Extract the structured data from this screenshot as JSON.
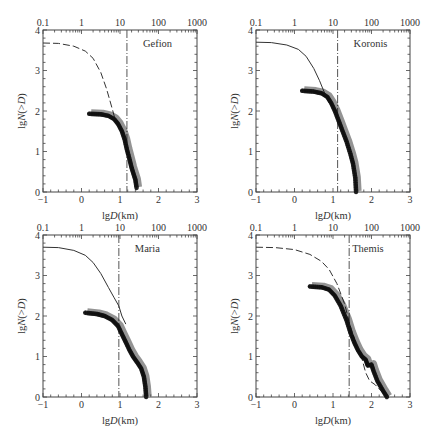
{
  "chart_data": [
    {
      "type": "line",
      "title": "Gefion",
      "xlabel": "lgD(km)",
      "ylabel": "lgN(>D)",
      "xlim": [
        -1,
        3
      ],
      "ylim": [
        0,
        4
      ],
      "x_ticks": [
        "-1",
        "0",
        "1",
        "2",
        "3"
      ],
      "y_ticks": [
        "0",
        "1",
        "2",
        "3",
        "4"
      ],
      "top_axis_ticks": [
        "0.1",
        "1",
        "10",
        "100",
        "1000"
      ],
      "vertical_dashdot_x": 1.18,
      "series": [
        {
          "name": "model (dashed)",
          "x": [
            -1,
            -0.6,
            -0.2,
            0.1,
            0.3,
            0.5,
            0.65,
            0.8,
            0.9
          ],
          "y": [
            3.68,
            3.67,
            3.6,
            3.48,
            3.3,
            2.95,
            2.55,
            2.05,
            1.7
          ]
        },
        {
          "name": "observed (crosses)",
          "x": [
            0.2,
            0.5,
            0.7,
            0.85,
            0.95,
            1.05,
            1.12,
            1.18,
            1.25,
            1.3,
            1.35,
            1.4,
            1.43
          ],
          "y": [
            1.93,
            1.92,
            1.88,
            1.8,
            1.68,
            1.5,
            1.3,
            1.05,
            0.8,
            0.6,
            0.45,
            0.3,
            0.1
          ]
        }
      ]
    },
    {
      "type": "line",
      "title": "Koronis",
      "xlabel": "lgD(km)",
      "ylabel": "lgN(>D)",
      "xlim": [
        -1,
        3
      ],
      "ylim": [
        0,
        4
      ],
      "x_ticks": [
        "-1",
        "0",
        "1",
        "2",
        "3"
      ],
      "y_ticks": [
        "0",
        "1",
        "2",
        "3",
        "4"
      ],
      "top_axis_ticks": [
        "0.1",
        "1",
        "10",
        "100",
        "1000"
      ],
      "vertical_dashdot_x": 1.12,
      "series": [
        {
          "name": "model (solid)",
          "x": [
            -1,
            -0.6,
            -0.2,
            0.1,
            0.3,
            0.5,
            0.65,
            0.8,
            0.9
          ],
          "y": [
            3.7,
            3.69,
            3.63,
            3.52,
            3.35,
            3.05,
            2.75,
            2.4,
            2.2
          ]
        },
        {
          "name": "observed (crosses)",
          "x": [
            0.2,
            0.5,
            0.7,
            0.85,
            0.95,
            1.05,
            1.15,
            1.25,
            1.35,
            1.45,
            1.52,
            1.58,
            1.6
          ],
          "y": [
            2.5,
            2.48,
            2.44,
            2.35,
            2.2,
            2.0,
            1.75,
            1.5,
            1.25,
            0.95,
            0.7,
            0.35,
            0.0
          ]
        }
      ]
    },
    {
      "type": "line",
      "title": "Maria",
      "xlabel": "lgD(km)",
      "ylabel": "lgN(>D)",
      "xlim": [
        -1,
        3
      ],
      "ylim": [
        0,
        4
      ],
      "x_ticks": [
        "-1",
        "0",
        "1",
        "2",
        "3"
      ],
      "y_ticks": [
        "0",
        "1",
        "2",
        "3",
        "4"
      ],
      "top_axis_ticks": [
        "0.1",
        "1",
        "10",
        "100",
        "1000"
      ],
      "vertical_dashdot_x": 0.97,
      "series": [
        {
          "name": "model (solid)",
          "x": [
            -1,
            -0.6,
            -0.2,
            0.1,
            0.3,
            0.5,
            0.7,
            0.85,
            0.97,
            1.05,
            1.15
          ],
          "y": [
            3.7,
            3.69,
            3.62,
            3.5,
            3.32,
            3.05,
            2.7,
            2.45,
            2.25,
            2.0,
            1.8
          ]
        },
        {
          "name": "observed (crosses)",
          "x": [
            0.1,
            0.4,
            0.6,
            0.8,
            0.95,
            1.05,
            1.15,
            1.25,
            1.35,
            1.45,
            1.55,
            1.62,
            1.66,
            1.68
          ],
          "y": [
            2.08,
            2.05,
            2.0,
            1.9,
            1.75,
            1.55,
            1.35,
            1.15,
            0.98,
            0.85,
            0.7,
            0.5,
            0.25,
            0.0
          ]
        }
      ]
    },
    {
      "type": "line",
      "title": "Themis",
      "xlabel": "lgD(km)",
      "ylabel": "lgN(>D)",
      "xlim": [
        -1,
        3
      ],
      "ylim": [
        0,
        4
      ],
      "x_ticks": [
        "-1",
        "0",
        "1",
        "2",
        "3"
      ],
      "y_ticks": [
        "0",
        "1",
        "2",
        "3",
        "4"
      ],
      "top_axis_ticks": [
        "0.1",
        "1",
        "10",
        "100",
        "1000"
      ],
      "vertical_dashdot_x": 1.42,
      "series": [
        {
          "name": "model (dashed)",
          "x": [
            -1,
            -0.5,
            0,
            0.4,
            0.7,
            0.9,
            1.1,
            1.3,
            1.45,
            1.6,
            1.75,
            1.85,
            1.95,
            2.1,
            2.25,
            2.4
          ],
          "y": [
            3.7,
            3.69,
            3.64,
            3.52,
            3.35,
            3.15,
            2.8,
            2.3,
            1.75,
            1.3,
            0.95,
            0.6,
            0.4,
            0.3,
            0.15,
            0.0
          ]
        },
        {
          "name": "observed (crosses)",
          "x": [
            0.4,
            0.7,
            0.9,
            1.05,
            1.2,
            1.35,
            1.45,
            1.55,
            1.65,
            1.75,
            1.85,
            1.9,
            2.0,
            2.05,
            2.15,
            2.3,
            2.4
          ],
          "y": [
            2.73,
            2.71,
            2.65,
            2.5,
            2.25,
            1.9,
            1.6,
            1.35,
            1.15,
            1.0,
            0.92,
            0.78,
            0.8,
            0.65,
            0.4,
            0.15,
            0.0
          ]
        }
      ]
    }
  ],
  "panels": [
    {
      "name": "Gefion"
    },
    {
      "name": "Koronis"
    },
    {
      "name": "Maria"
    },
    {
      "name": "Themis"
    }
  ],
  "axes": {
    "xlabel_prefix": "lg",
    "xlabel_var": "D",
    "xlabel_suffix": "(km)",
    "ylabel": "lgN(>D)",
    "x_ticks": [
      "-1",
      "0",
      "1",
      "2",
      "3"
    ],
    "y_ticks": [
      "0",
      "1",
      "2",
      "3",
      "4"
    ],
    "top_ticks": [
      "0.1",
      "1",
      "10",
      "100",
      "1000"
    ]
  },
  "colors": {
    "ink": "#222222",
    "frame": "#444444",
    "background": "#ffffff"
  }
}
